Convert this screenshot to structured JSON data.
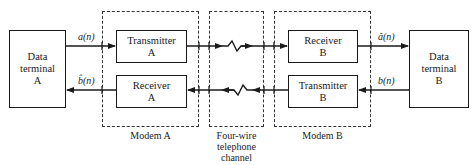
{
  "diagram": {
    "type": "block-diagram",
    "terminals": [
      {
        "id": "data-terminal-a",
        "lines": [
          "Data",
          "terminal",
          "A"
        ]
      },
      {
        "id": "data-terminal-b",
        "lines": [
          "Data",
          "terminal",
          "B"
        ]
      }
    ],
    "modems": [
      {
        "id": "modem-a",
        "label": "Modem A",
        "blocks": [
          {
            "id": "transmitter-a",
            "lines": [
              "Transmitter",
              "A"
            ]
          },
          {
            "id": "receiver-a",
            "lines": [
              "Receiver",
              "A"
            ]
          }
        ]
      },
      {
        "id": "modem-b",
        "label": "Modem B",
        "blocks": [
          {
            "id": "receiver-b",
            "lines": [
              "Receiver",
              "B"
            ]
          },
          {
            "id": "transmitter-b",
            "lines": [
              "Transmitter",
              "B"
            ]
          }
        ]
      }
    ],
    "channel": {
      "lines": [
        "Four-wire",
        "telephone",
        "channel"
      ]
    },
    "signals": {
      "a_n": "a(n)",
      "b_hat_n": "b̂(n)",
      "a_hat_n": "â(n)",
      "b_n": "b(n)"
    },
    "edges": [
      {
        "from": "data-terminal-a",
        "to": "transmitter-a",
        "label": "a(n)"
      },
      {
        "from": "transmitter-a",
        "to": "receiver-b",
        "via": "four-wire channel"
      },
      {
        "from": "receiver-b",
        "to": "data-terminal-b",
        "label": "â(n)"
      },
      {
        "from": "data-terminal-b",
        "to": "transmitter-b",
        "label": "b(n)"
      },
      {
        "from": "transmitter-b",
        "to": "receiver-a",
        "via": "four-wire channel"
      },
      {
        "from": "receiver-a",
        "to": "data-terminal-a",
        "label": "b̂(n)"
      }
    ]
  }
}
